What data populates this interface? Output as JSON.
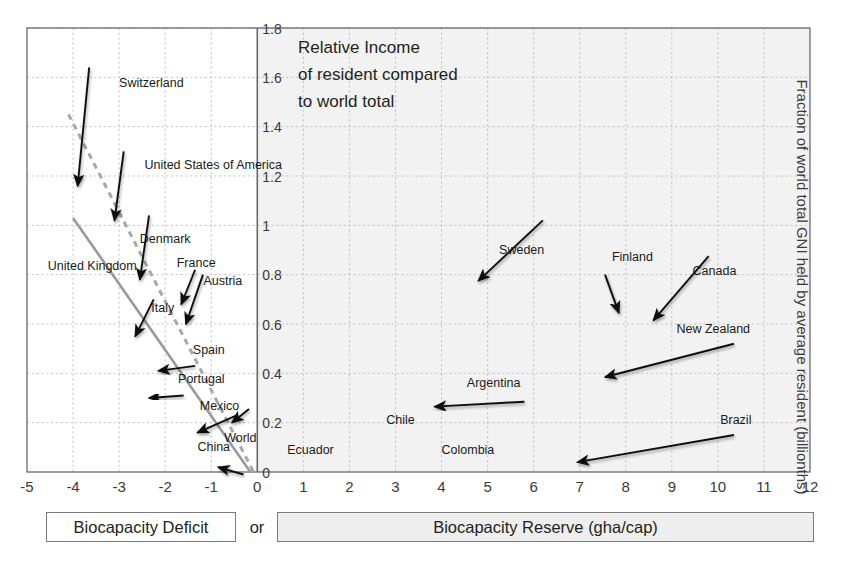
{
  "figure": {
    "title_lines": [
      "Relative Income",
      "of resident compared",
      "to world total"
    ],
    "right_axis_label": "Fraction of world total GNI held by average resident (billionths)",
    "bottom_bands": {
      "deficit_label": "Biocapacity Deficit",
      "or_label": "or",
      "reserve_label": "Biocapacity Reserve (gha/cap)"
    },
    "colors": {
      "plot_left_bg": "#ffffff",
      "plot_right_bg": "#f2f2f2",
      "grid": "#bdbdbd",
      "frame": "#6b6b6b",
      "arrow": "#111111",
      "trend_solid": "#9a9a9a",
      "trend_dashed": "#a8a8a8",
      "text": "#231f20"
    }
  },
  "chart_data": {
    "type": "scatter",
    "title": "Relative Income of resident compared to world total",
    "xlabel": "Biocapacity Deficit or Biocapacity Reserve (gha/cap)",
    "ylabel": "Fraction of world total GNI held by average resident (billionths)",
    "xlim": [
      -5,
      12
    ],
    "ylim": [
      0,
      1.8
    ],
    "grid": true,
    "legend": "none",
    "xticks": [
      "-5",
      "-4",
      "-3",
      "-2",
      "-1",
      "0",
      "1",
      "2",
      "3",
      "4",
      "5",
      "6",
      "7",
      "8",
      "9",
      "10",
      "11",
      "12"
    ],
    "yticks": [
      "0",
      "0.2",
      "0.4",
      "0.6",
      "0.8",
      "1",
      "1.2",
      "1.4",
      "1.6",
      "1.8"
    ],
    "points": [
      {
        "label": "Switzerland",
        "x": -3.9,
        "y": 1.16,
        "label_x": -3.0,
        "label_y": 1.56,
        "tail_x": -3.65,
        "tail_y": 1.64
      },
      {
        "label": "United States of America",
        "x": -3.1,
        "y": 1.02,
        "label_x": -2.45,
        "label_y": 1.23,
        "tail_x": -2.9,
        "tail_y": 1.3
      },
      {
        "label": "Denmark",
        "x": -2.55,
        "y": 0.78,
        "label_x": -2.55,
        "label_y": 0.93,
        "tail_x": -2.35,
        "tail_y": 1.04
      },
      {
        "label": "United Kingdom",
        "x": -2.9,
        "y": 0.7,
        "label_x": -4.55,
        "label_y": 0.82,
        "tail_x": -2.9,
        "tail_y": 0.86
      },
      {
        "label": "France",
        "x": -1.65,
        "y": 0.68,
        "label_x": -1.75,
        "label_y": 0.83,
        "tail_x": -1.35,
        "tail_y": 0.82
      },
      {
        "label": "Austria",
        "x": -1.55,
        "y": 0.6,
        "label_x": -1.17,
        "label_y": 0.76,
        "tail_x": -1.18,
        "tail_y": 0.8
      },
      {
        "label": "Italy",
        "x": -2.65,
        "y": 0.55,
        "label_x": -2.3,
        "label_y": 0.65,
        "tail_x": -2.25,
        "tail_y": 0.7
      },
      {
        "label": "Spain",
        "x": -2.15,
        "y": 0.41,
        "label_x": -1.4,
        "label_y": 0.48,
        "tail_x": -1.35,
        "tail_y": 0.43
      },
      {
        "label": "Portugal",
        "x": -2.35,
        "y": 0.3,
        "label_x": -1.72,
        "label_y": 0.36,
        "tail_x": -1.6,
        "tail_y": 0.31
      },
      {
        "label": "Mexico",
        "x": -1.3,
        "y": 0.16,
        "label_x": -1.25,
        "label_y": 0.25,
        "tail_x": -0.45,
        "tail_y": 0.23
      },
      {
        "label": "World",
        "x": -0.55,
        "y": 0.2,
        "label_x": -0.72,
        "label_y": 0.12,
        "tail_x": -0.18,
        "tail_y": 0.255
      },
      {
        "label": "China",
        "x": -0.85,
        "y": 0.02,
        "label_x": -1.3,
        "label_y": 0.085,
        "tail_x": -0.3,
        "tail_y": -0.01
      },
      {
        "label": "Ecuador",
        "x": 0.3,
        "y": 0.02,
        "label_x": 0.65,
        "label_y": 0.075,
        "tail_x": 1.85,
        "tail_y": 0.02
      },
      {
        "label": "Chile",
        "x": 1.2,
        "y": 0.155,
        "label_x": 2.8,
        "label_y": 0.195,
        "tail_x": 3.6,
        "tail_y": 0.155
      },
      {
        "label": "Colombia",
        "x": 1.85,
        "y": 0.04,
        "label_x": 4.0,
        "label_y": 0.075,
        "tail_x": 3.95,
        "tail_y": 0.04
      },
      {
        "label": "Argentina",
        "x": 3.85,
        "y": 0.265,
        "label_x": 4.55,
        "label_y": 0.345,
        "tail_x": 5.8,
        "tail_y": 0.285
      },
      {
        "label": "Sweden",
        "x": 4.8,
        "y": 0.775,
        "label_x": 5.25,
        "label_y": 0.885,
        "tail_x": 6.2,
        "tail_y": 1.02
      },
      {
        "label": "Finland",
        "x": 7.85,
        "y": 0.645,
        "label_x": 7.7,
        "label_y": 0.855,
        "tail_x": 7.55,
        "tail_y": 0.8
      },
      {
        "label": "Canada",
        "x": 8.6,
        "y": 0.615,
        "label_x": 9.45,
        "label_y": 0.8,
        "tail_x": 9.8,
        "tail_y": 0.875
      },
      {
        "label": "New Zealand",
        "x": 7.55,
        "y": 0.385,
        "label_x": 9.1,
        "label_y": 0.565,
        "tail_x": 10.35,
        "tail_y": 0.52
      },
      {
        "label": "Brazil",
        "x": 6.95,
        "y": 0.04,
        "label_x": 10.05,
        "label_y": 0.195,
        "tail_x": 10.35,
        "tail_y": 0.15
      }
    ],
    "trend_lines": [
      {
        "name": "solid-trend",
        "style": "solid",
        "x1": -4.0,
        "y1": 1.03,
        "x2": -0.15,
        "y2": 0.0
      },
      {
        "name": "dashed-trend",
        "style": "dashed",
        "x1": -4.1,
        "y1": 1.45,
        "x2": -0.08,
        "y2": 0.0
      }
    ]
  }
}
